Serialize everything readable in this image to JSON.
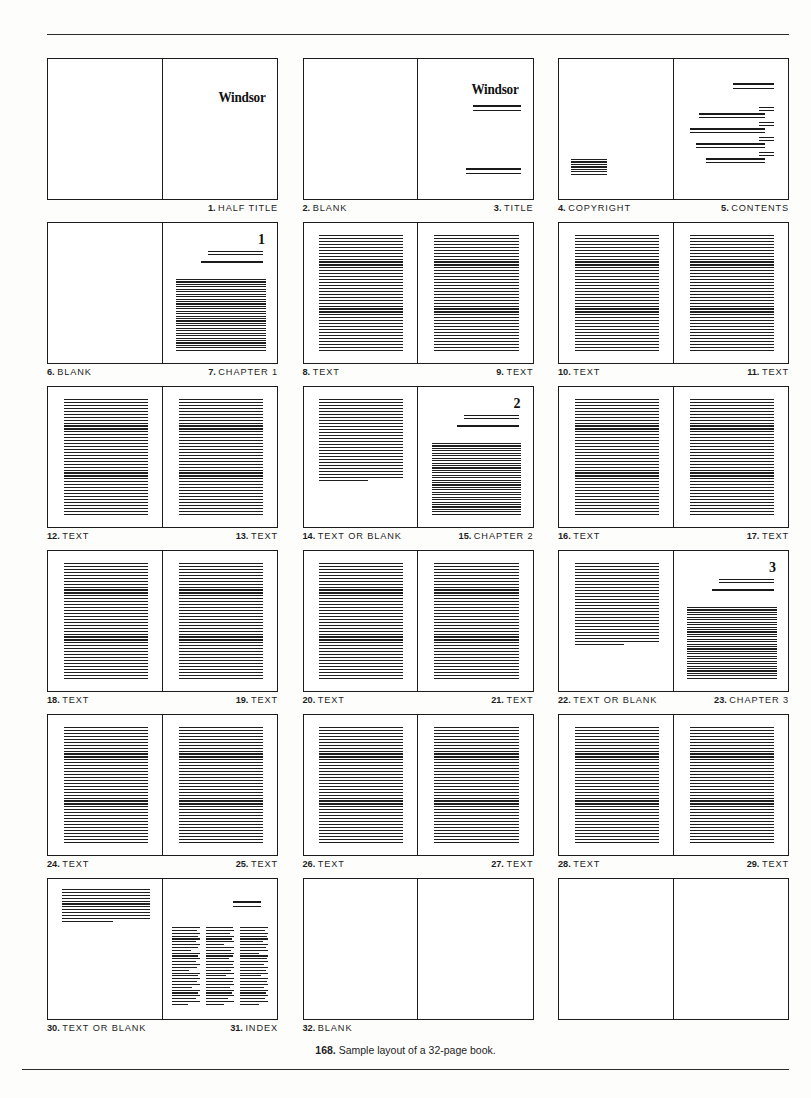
{
  "figure": {
    "number": "168.",
    "caption": "Sample layout of a 32-page book."
  },
  "book_title_word": "Windsor",
  "chapter_numerals": {
    "ch1": "1",
    "ch2": "2",
    "ch3": "3"
  },
  "spreads": [
    {
      "left": {
        "page": "1",
        "label": "HALF TITLE",
        "kind": "blank",
        "side": "verso"
      },
      "right": {
        "page": "1",
        "label": "HALF TITLE",
        "kind": "half-title",
        "side": "recto"
      },
      "labels": [
        {
          "num": "1.",
          "text": "HALF TITLE",
          "align": "right"
        }
      ]
    },
    {
      "left": {
        "page": "2",
        "label": "BLANK",
        "kind": "blank"
      },
      "right": {
        "page": "3",
        "label": "TITLE",
        "kind": "title-page"
      },
      "labels": [
        {
          "num": "2.",
          "text": "BLANK",
          "align": "left"
        },
        {
          "num": "3.",
          "text": "TITLE",
          "align": "right"
        }
      ]
    },
    {
      "left": {
        "page": "4",
        "label": "COPYRIGHT",
        "kind": "copyright"
      },
      "right": {
        "page": "5",
        "label": "CONTENTS",
        "kind": "contents"
      },
      "labels": [
        {
          "num": "4.",
          "text": "COPYRIGHT",
          "align": "left"
        },
        {
          "num": "5.",
          "text": "CONTENTS",
          "align": "right"
        }
      ]
    },
    {
      "left": {
        "page": "6",
        "label": "BLANK",
        "kind": "blank"
      },
      "right": {
        "page": "7",
        "label": "CHAPTER 1",
        "kind": "chapter-opener",
        "numeral": "1"
      },
      "labels": [
        {
          "num": "6.",
          "text": "BLANK",
          "align": "left"
        },
        {
          "num": "7.",
          "text": "CHAPTER 1",
          "align": "right"
        }
      ]
    },
    {
      "left": {
        "page": "8",
        "label": "TEXT",
        "kind": "text-full"
      },
      "right": {
        "page": "9",
        "label": "TEXT",
        "kind": "text-full"
      },
      "labels": [
        {
          "num": "8.",
          "text": "TEXT",
          "align": "left"
        },
        {
          "num": "9.",
          "text": "TEXT",
          "align": "right"
        }
      ]
    },
    {
      "left": {
        "page": "10",
        "label": "TEXT",
        "kind": "text-full"
      },
      "right": {
        "page": "11",
        "label": "TEXT",
        "kind": "text-full"
      },
      "labels": [
        {
          "num": "10.",
          "text": "TEXT",
          "align": "left"
        },
        {
          "num": "11.",
          "text": "TEXT",
          "align": "right"
        }
      ]
    },
    {
      "left": {
        "page": "12",
        "label": "TEXT",
        "kind": "text-full"
      },
      "right": {
        "page": "13",
        "label": "TEXT",
        "kind": "text-full"
      },
      "labels": [
        {
          "num": "12.",
          "text": "TEXT",
          "align": "left"
        },
        {
          "num": "13.",
          "text": "TEXT",
          "align": "right"
        }
      ]
    },
    {
      "left": {
        "page": "14",
        "label": "TEXT OR BLANK",
        "kind": "text-partial"
      },
      "right": {
        "page": "15",
        "label": "CHAPTER 2",
        "kind": "chapter-opener",
        "numeral": "2"
      },
      "labels": [
        {
          "num": "14.",
          "text": "TEXT OR BLANK",
          "align": "left"
        },
        {
          "num": "15.",
          "text": "CHAPTER 2",
          "align": "right"
        }
      ]
    },
    {
      "left": {
        "page": "16",
        "label": "TEXT",
        "kind": "text-full"
      },
      "right": {
        "page": "17",
        "label": "TEXT",
        "kind": "text-full"
      },
      "labels": [
        {
          "num": "16.",
          "text": "TEXT",
          "align": "left"
        },
        {
          "num": "17.",
          "text": "TEXT",
          "align": "right"
        }
      ]
    },
    {
      "left": {
        "page": "18",
        "label": "TEXT",
        "kind": "text-full"
      },
      "right": {
        "page": "19",
        "label": "TEXT",
        "kind": "text-full"
      },
      "labels": [
        {
          "num": "18.",
          "text": "TEXT",
          "align": "left"
        },
        {
          "num": "19.",
          "text": "TEXT",
          "align": "right"
        }
      ]
    },
    {
      "left": {
        "page": "20",
        "label": "TEXT",
        "kind": "text-full"
      },
      "right": {
        "page": "21",
        "label": "TEXT",
        "kind": "text-full"
      },
      "labels": [
        {
          "num": "20.",
          "text": "TEXT",
          "align": "left"
        },
        {
          "num": "21.",
          "text": "TEXT",
          "align": "right"
        }
      ]
    },
    {
      "left": {
        "page": "22",
        "label": "TEXT OR BLANK",
        "kind": "text-partial"
      },
      "right": {
        "page": "23",
        "label": "CHAPTER 3",
        "kind": "chapter-opener",
        "numeral": "3"
      },
      "labels": [
        {
          "num": "22.",
          "text": "TEXT OR BLANK",
          "align": "left"
        },
        {
          "num": "23.",
          "text": "CHAPTER 3",
          "align": "right"
        }
      ]
    },
    {
      "left": {
        "page": "24",
        "label": "TEXT",
        "kind": "text-full"
      },
      "right": {
        "page": "25",
        "label": "TEXT",
        "kind": "text-full"
      },
      "labels": [
        {
          "num": "24.",
          "text": "TEXT",
          "align": "left"
        },
        {
          "num": "25.",
          "text": "TEXT",
          "align": "right"
        }
      ]
    },
    {
      "left": {
        "page": "26",
        "label": "TEXT",
        "kind": "text-full"
      },
      "right": {
        "page": "27",
        "label": "TEXT",
        "kind": "text-full"
      },
      "labels": [
        {
          "num": "26.",
          "text": "TEXT",
          "align": "left"
        },
        {
          "num": "27.",
          "text": "TEXT",
          "align": "right"
        }
      ]
    },
    {
      "left": {
        "page": "28",
        "label": "TEXT",
        "kind": "text-full"
      },
      "right": {
        "page": "29",
        "label": "TEXT",
        "kind": "text-full"
      },
      "labels": [
        {
          "num": "28.",
          "text": "TEXT",
          "align": "left"
        },
        {
          "num": "29.",
          "text": "TEXT",
          "align": "right"
        }
      ]
    },
    {
      "left": {
        "page": "30",
        "label": "TEXT OR BLANK",
        "kind": "text-partial-top"
      },
      "right": {
        "page": "31",
        "label": "INDEX",
        "kind": "index"
      },
      "labels": [
        {
          "num": "30.",
          "text": "TEXT OR BLANK",
          "align": "left"
        },
        {
          "num": "31.",
          "text": "INDEX",
          "align": "right"
        }
      ]
    },
    {
      "left": {
        "page": "32",
        "label": "BLANK",
        "kind": "blank"
      },
      "right": {
        "page": "",
        "label": "",
        "kind": "blank"
      },
      "labels": [
        {
          "num": "32.",
          "text": "BLANK",
          "align": "left"
        }
      ]
    },
    {
      "left": {
        "page": "",
        "label": "",
        "kind": "blank"
      },
      "right": {
        "page": "",
        "label": "",
        "kind": "blank"
      },
      "labels": []
    }
  ],
  "colors": {
    "ink": "#1a1a1a",
    "rule": "#1f1f1f",
    "paper": "#ffffff"
  }
}
